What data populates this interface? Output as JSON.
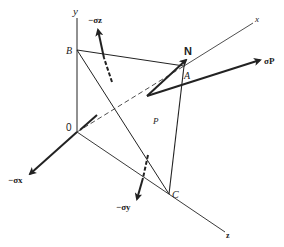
{
  "diagram": {
    "title": "",
    "axes": {
      "x_label": "x",
      "y_label": "y",
      "z_label": "z",
      "origin_label": "0"
    },
    "points": {
      "A": "A",
      "B": "B",
      "C": "C",
      "plane": "P",
      "normal": "N"
    },
    "stresses": {
      "sigma_x": "−σx",
      "sigma_y": "−σy",
      "sigma_z": "−σz",
      "sigma_p": "σP"
    },
    "colors": {
      "line": "#222222",
      "background": "#ffffff"
    }
  }
}
